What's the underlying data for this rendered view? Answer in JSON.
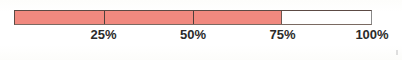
{
  "chart_data": {
    "type": "bar",
    "title": "",
    "subtitle": "",
    "xlabel": "",
    "ylabel": "",
    "orientation": "horizontal",
    "categories": [
      "Completion"
    ],
    "values": [
      75
    ],
    "unit": "%",
    "xlim": [
      0,
      100
    ],
    "grid": false,
    "legend": null,
    "tick_labels": [
      "25%",
      "50%",
      "75%",
      "100%"
    ],
    "tick_values": [
      25,
      50,
      75,
      100
    ],
    "segment_dividers": [
      25,
      50
    ],
    "fill_percent": 75,
    "fill_color": "#f1897f",
    "track_color": "#ffffff",
    "border_color": "#5c4a44",
    "divider_color": "#4e3f3a",
    "label_color": "#2b2b2b"
  },
  "gauge": {
    "name": "progress-gauge",
    "fill_percent": 75,
    "fill_label": "75%",
    "aria_value_text": "75%"
  },
  "ticks": [
    {
      "label": "25%",
      "value": 25,
      "position_percent": 25
    },
    {
      "label": "50%",
      "value": 50,
      "position_percent": 50
    },
    {
      "label": "75%",
      "value": 75,
      "position_percent": 75
    },
    {
      "label": "100%",
      "value": 100,
      "position_percent": 100
    }
  ]
}
